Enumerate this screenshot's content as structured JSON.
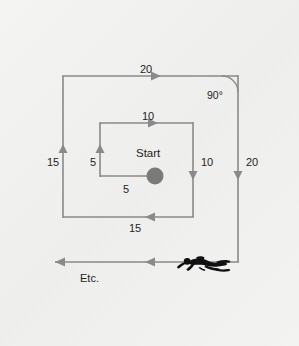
{
  "figure": {
    "background_color": "#f1f1f0",
    "line_color": "#8a8a8a",
    "dot_color": "#7a7a7a",
    "text_color": "#242424",
    "start_label": "Start",
    "etc_label": "Etc.",
    "angle_label": "90°",
    "segments": [
      {
        "name": "inner-up-5",
        "label": "5",
        "direction": "up",
        "orientation": "vertical"
      },
      {
        "name": "inner-right-5",
        "label": "5",
        "direction": "right",
        "orientation": "horizontal"
      },
      {
        "name": "inner-top-10",
        "label": "10",
        "direction": "right",
        "orientation": "horizontal"
      },
      {
        "name": "inner-right-10",
        "label": "10",
        "direction": "down",
        "orientation": "vertical"
      },
      {
        "name": "inner-bottom-15",
        "label": "15",
        "direction": "left",
        "orientation": "horizontal"
      },
      {
        "name": "outer-left-15",
        "label": "15",
        "direction": "up",
        "orientation": "vertical"
      },
      {
        "name": "outer-top-20",
        "label": "20",
        "direction": "right",
        "orientation": "horizontal"
      },
      {
        "name": "outer-right-20",
        "label": "20",
        "direction": "down",
        "orientation": "vertical"
      },
      {
        "name": "outer-bottom-etc",
        "label": "Etc.",
        "direction": "left",
        "orientation": "horizontal"
      }
    ],
    "diver_icon": "scuba-diver-silhouette"
  }
}
